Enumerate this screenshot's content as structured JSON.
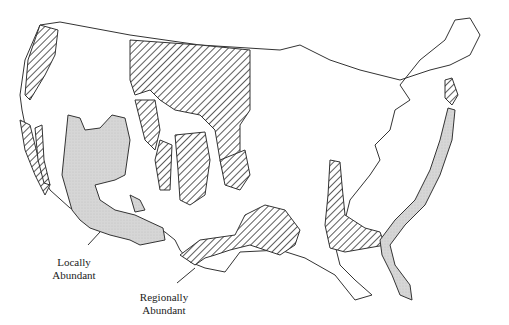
{
  "map": {
    "title": "",
    "region": "Contiguous United States",
    "legend": {
      "locally_abundant": {
        "label_line1": "Locally",
        "label_line2": "Abundant",
        "fill": "stippled gray",
        "color": "#d8d8d8"
      },
      "regionally_abundant": {
        "label_line1": "Regionally",
        "label_line2": "Abundant",
        "fill": "diagonal hatch",
        "color": "#333333"
      }
    },
    "colors": {
      "background": "#ffffff",
      "outline": "#333333",
      "stipple": "#d8d8d8"
    }
  }
}
